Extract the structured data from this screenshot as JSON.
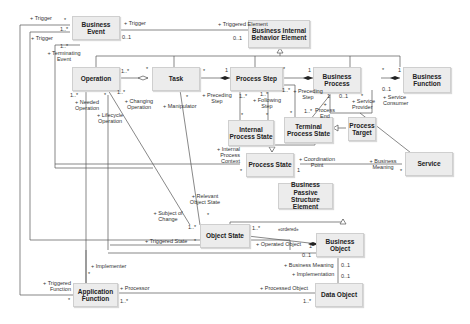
{
  "diagram": {
    "type": "uml-class-diagram",
    "classes": {
      "business_event": "Business Event",
      "business_internal_behavior_element": "Business Internal Behavior Element",
      "operation": "Operation",
      "task": "Task",
      "process_step": "Process Step",
      "business_process": "Business Process",
      "business_function": "Business Function",
      "internal_process_state": "Internal Process State",
      "terminal_process_state": "Terminal Process State",
      "process_target": "Process Target",
      "process_state": "Process State",
      "service": "Service",
      "business_passive_structure_element": "Business Passive Structure Element",
      "object_state": "Object State",
      "business_object": "Business Object",
      "application_function": "Application Function",
      "data_object": "Data Object"
    },
    "labels": {
      "trigger_top": "+ Trigger",
      "trigger_top_mult": "*",
      "trigger_right": "+ Trigger",
      "trigger_left": "+ Trigger",
      "be_mult_1": "1..*",
      "be_mult_2": "1..*",
      "be_mult_01": "0..1",
      "triggered_element": "+ Triggered  Element",
      "triggered_element_mult": "0..1",
      "terminating_event": "+ Terminating Event",
      "op_task_mult_op": "1..*",
      "op_task_mult_task": "*",
      "op_mult_bottom": "1..*",
      "op_star": "*",
      "op_mult_right": "1..*",
      "needed_operation": "+ Needed Operation",
      "lifecycle_operation": "+ Lifecycle Operation",
      "changing_operation": "+ Changing Operation",
      "task_ps_mult_task": "*",
      "task_ps_mult_ps": "1",
      "manipulator": "+ Manipulator",
      "manipulator_mult": "*",
      "preceding_step_1": "+ Preceding Step",
      "ps_mult_a": "1..*",
      "ps_mult_b": "1..*",
      "following_step": "+ Following Step",
      "ps_mult_c": "1..*",
      "preceding_step_2": "+ Preceding Step",
      "ps_star": "*",
      "ips_star_1": "*",
      "ips_star_2": "*",
      "tps_star": "*",
      "bp_mult_1": "1",
      "bp_mult_1b": "1",
      "bp_mult_tps": "1..*",
      "process_end": "+ Process End",
      "bp_mult_01": "0..1",
      "service_provider_mult": "*",
      "service_provider": "+ Service Provider",
      "service_consumer_mult": "0..1",
      "service_consumer": "+ Service Consumer",
      "bp_bf_star": "*",
      "bp_bf_1": "1",
      "internal_process_context": "+ Internal Process Context",
      "ps_state_star": "*",
      "ps_state_1": "1",
      "coordination_point": "+ Coordination Point",
      "business_meaning_1": "+ Business Meaning",
      "service_star": "*",
      "relevant_object_state": "+ Relevant Object State",
      "ros_star": "*",
      "subject_of_change": "+ Subject of Change",
      "soc_mult": "1..*",
      "triggered_state": "+ Triggered State",
      "ts_star": "*",
      "os_mult": "1..*",
      "ordered": "«ordered»",
      "operated_object": "+ Operated Object",
      "bo_mult_1": "1",
      "bo_mult_01": "0..1",
      "business_meaning_2": "+ Business Meaning",
      "implementation": "+ Implementation",
      "do_mult_01a": "0..1",
      "do_mult_01b": "0..1",
      "implementer": "+ Implementer",
      "implementer_star": "*",
      "triggered_function": "+ Triggered Function",
      "af_star": "*",
      "processor": "+ Processor",
      "processor_mult": "1..*",
      "processed_object": "+ Processed Object",
      "processed_mult": "1..*"
    }
  }
}
